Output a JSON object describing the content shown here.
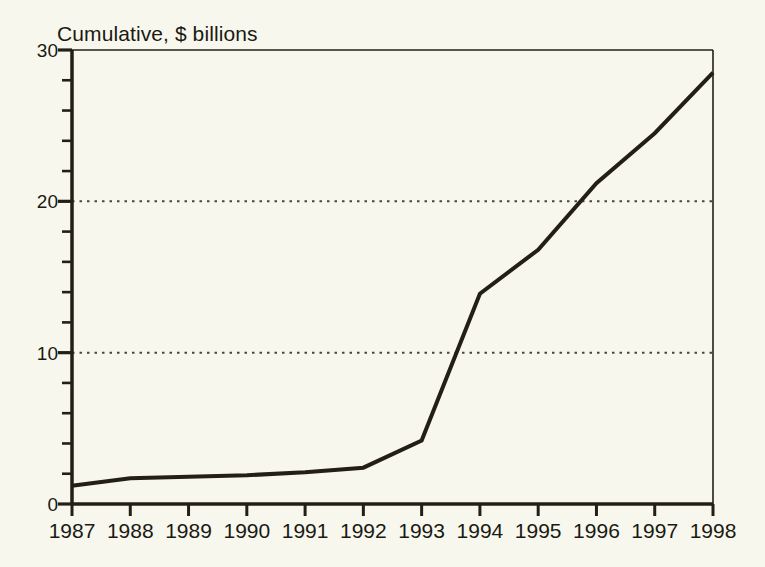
{
  "chart_data": {
    "type": "line",
    "title": "Cumulative, $ billions",
    "xlabel": "",
    "ylabel": "",
    "categories": [
      "1987",
      "1988",
      "1989",
      "1990",
      "1991",
      "1992",
      "1993",
      "1994",
      "1995",
      "1996",
      "1997",
      "1998"
    ],
    "x": [
      1987,
      1988,
      1989,
      1990,
      1991,
      1992,
      1993,
      1994,
      1995,
      1996,
      1997,
      1998
    ],
    "values": [
      1.2,
      1.7,
      1.8,
      1.9,
      2.1,
      2.4,
      4.2,
      13.9,
      16.8,
      21.2,
      24.5,
      28.5
    ],
    "series": [
      {
        "name": "Cumulative",
        "values": [
          1.2,
          1.7,
          1.8,
          1.9,
          2.1,
          2.4,
          4.2,
          13.9,
          16.8,
          21.2,
          24.5,
          28.5
        ]
      }
    ],
    "ylim": [
      0,
      30
    ],
    "xlim": [
      1987,
      1998
    ],
    "y_major_ticks": [
      0,
      10,
      20,
      30
    ],
    "y_major_tick_labels": [
      "0",
      "10",
      "20",
      "30"
    ],
    "y_minor_tick_interval": 2,
    "gridlines": {
      "y_values": [
        10,
        20
      ],
      "style": "dotted",
      "x_grid": false
    },
    "legend": {
      "visible": false,
      "position": "none"
    },
    "colors": {
      "background": "#f8f7ed",
      "line": "#231f16",
      "axis": "#231f16",
      "grid": "#4a463a",
      "text": "#1a1a14"
    },
    "line_width_px": 4
  },
  "axes": {
    "y_labels": [
      "30",
      "20",
      "10",
      "0"
    ],
    "x_labels": [
      "1987",
      "1988",
      "1989",
      "1990",
      "1991",
      "1992",
      "1993",
      "1994",
      "1995",
      "1996",
      "1997",
      "1998"
    ]
  }
}
